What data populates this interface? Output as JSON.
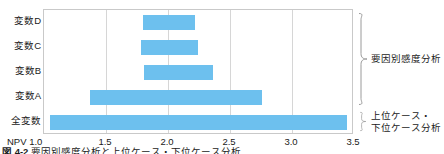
{
  "chart_data": {
    "type": "bar",
    "orientation": "horizontal",
    "title": "",
    "xlabel": "NPV",
    "ylabel": "",
    "xlim": [
      1.0,
      3.5
    ],
    "xticks": [
      1.0,
      1.5,
      2.0,
      2.5,
      3.0,
      3.5
    ],
    "xtick_labels": [
      "NPV 1.0",
      "1.5",
      "2.0",
      "2.5",
      "3.0",
      "3.5"
    ],
    "grid": true,
    "legend": false,
    "bar_color": "#6dc0ee",
    "categories": [
      "変数D",
      "変数C",
      "変数B",
      "変数A",
      "全変数"
    ],
    "bars": [
      {
        "label": "変数D",
        "low": 1.8,
        "high": 2.22
      },
      {
        "label": "変数C",
        "low": 1.78,
        "high": 2.24
      },
      {
        "label": "変数B",
        "low": 1.81,
        "high": 2.36
      },
      {
        "label": "変数A",
        "low": 1.37,
        "high": 2.76
      },
      {
        "label": "全変数",
        "low": 1.05,
        "high": 3.44
      }
    ],
    "annotations": [
      {
        "name": "factor-sensitivity",
        "text": "要因別感度分析",
        "covers": [
          "変数D",
          "変数C",
          "変数B",
          "変数A"
        ]
      },
      {
        "name": "case-analysis",
        "text": "上位ケース・\n下位ケース分析",
        "covers": [
          "全変数"
        ]
      }
    ]
  },
  "caption": {
    "number": "図 4-2",
    "body": "要因別感度分析と上位ケース・下位ケース分析"
  }
}
